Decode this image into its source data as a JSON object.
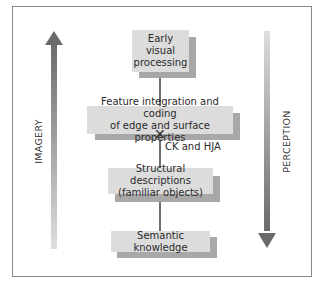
{
  "diagram": {
    "type": "hierarchical processing model",
    "nodes": [
      {
        "id": "early",
        "label_lines": [
          "Early",
          "visual",
          "processing"
        ]
      },
      {
        "id": "feature",
        "label_lines": [
          "Feature integration and coding",
          "of edge and surface properties"
        ]
      },
      {
        "id": "structural",
        "label_lines": [
          "Structural descriptions",
          "(familiar objects)"
        ]
      },
      {
        "id": "semantic",
        "label_lines": [
          "Semantic knowledge"
        ]
      }
    ],
    "edges": [
      {
        "from": "early",
        "to": "feature"
      },
      {
        "from": "feature",
        "to": "structural",
        "disrupted": true,
        "marker": "✕"
      },
      {
        "from": "structural",
        "to": "semantic"
      }
    ],
    "annotation": "CK and HJA",
    "left_axis": {
      "label": "IMAGERY",
      "direction": "up"
    },
    "right_axis": {
      "label": "PERCEPTION",
      "direction": "down"
    },
    "colors": {
      "box_fill": "#dcdcdc",
      "box_shadow": "#a8a8a8",
      "arrow_dark": "#6a6a6a",
      "arrow_light": "#d8d8d8",
      "frame": "#8a8a8a"
    }
  }
}
